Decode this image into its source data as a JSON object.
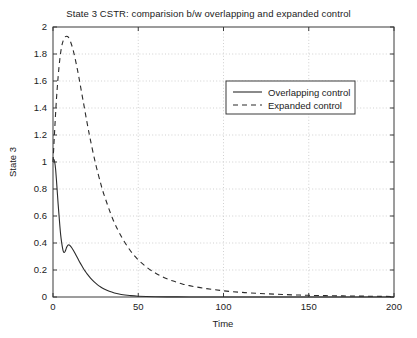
{
  "chart_data": {
    "type": "line",
    "title": "State 3 CSTR: comparision b/w overlapping and expanded control",
    "xlabel": "Time",
    "ylabel": "State 3",
    "xlim": [
      0,
      200
    ],
    "ylim": [
      0,
      2
    ],
    "grid": true,
    "legend_position": "upper right",
    "xticks": [
      0,
      50,
      100,
      150,
      200
    ],
    "xtick_labels": [
      "0",
      "50",
      "100",
      "150",
      "200"
    ],
    "yticks": [
      0,
      0.2,
      0.4,
      0.6,
      0.8,
      1,
      1.2,
      1.4,
      1.6,
      1.8,
      2
    ],
    "ytick_labels": [
      "0",
      "0.2",
      "0.4",
      "0.6",
      "0.8",
      "1",
      "1.2",
      "1.4",
      "1.6",
      "1.8",
      "2"
    ],
    "series": [
      {
        "name": "Overlapping control",
        "style": "solid",
        "color": "#2b2b2b",
        "x": [
          0,
          0.5,
          1,
          1.5,
          2,
          2.5,
          3,
          3.5,
          4,
          4.5,
          5,
          5.5,
          6,
          6.5,
          7,
          7.5,
          8,
          8.5,
          9,
          9.5,
          10,
          11,
          12,
          13,
          14,
          15,
          16,
          17,
          18,
          19,
          20,
          22,
          24,
          26,
          28,
          30,
          33,
          36,
          40,
          45,
          50,
          60,
          70,
          80,
          100,
          120,
          150,
          200
        ],
        "y": [
          1.02,
          1.02,
          1.0,
          0.95,
          0.87,
          0.78,
          0.69,
          0.61,
          0.53,
          0.46,
          0.41,
          0.37,
          0.34,
          0.33,
          0.335,
          0.35,
          0.368,
          0.38,
          0.386,
          0.386,
          0.381,
          0.365,
          0.345,
          0.322,
          0.298,
          0.274,
          0.251,
          0.229,
          0.208,
          0.189,
          0.171,
          0.14,
          0.114,
          0.092,
          0.074,
          0.059,
          0.042,
          0.03,
          0.019,
          0.011,
          0.006,
          0.002,
          0.001,
          0.0005,
          0.0002,
          0.0001,
          0.0,
          0.0
        ]
      },
      {
        "name": "Expanded control",
        "style": "dashed",
        "color": "#2b2b2b",
        "x": [
          0,
          1,
          2,
          3,
          4,
          5,
          6,
          7,
          8,
          9,
          10,
          11,
          12,
          13,
          14,
          15,
          16,
          18,
          20,
          22,
          25,
          28,
          30,
          35,
          40,
          45,
          50,
          55,
          60,
          65,
          70,
          75,
          80,
          90,
          100,
          110,
          120,
          130,
          140,
          150,
          160,
          170,
          180,
          190,
          200
        ],
        "y": [
          1.0,
          1.24,
          1.46,
          1.63,
          1.76,
          1.85,
          1.9,
          1.925,
          1.932,
          1.925,
          1.9,
          1.865,
          1.82,
          1.765,
          1.705,
          1.64,
          1.57,
          1.43,
          1.29,
          1.16,
          0.985,
          0.84,
          0.755,
          0.58,
          0.45,
          0.35,
          0.275,
          0.22,
          0.178,
          0.145,
          0.12,
          0.1,
          0.084,
          0.062,
          0.046,
          0.035,
          0.027,
          0.021,
          0.016,
          0.0125,
          0.01,
          0.008,
          0.0065,
          0.005,
          0.004
        ]
      }
    ]
  },
  "legend": {
    "items": [
      {
        "label": "Overlapping control",
        "style": "solid"
      },
      {
        "label": "Expanded control",
        "style": "dashed"
      }
    ]
  }
}
